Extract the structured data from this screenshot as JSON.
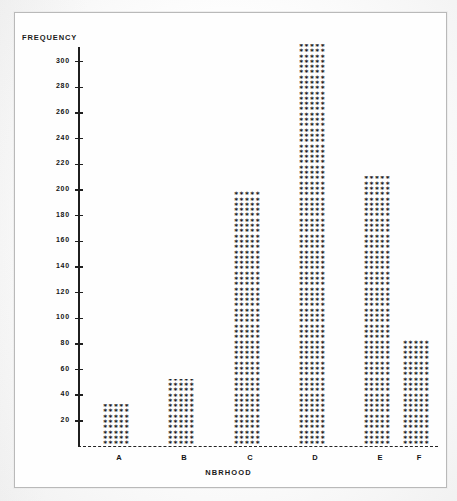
{
  "figure": {
    "frame_color": "#b9b9b9",
    "background": "#fdfdfd",
    "ink_color": "#121212"
  },
  "chart_data": {
    "type": "bar",
    "title": "",
    "xlabel": "NBRHOOD",
    "ylabel": "FREQUENCY",
    "categories": [
      "A",
      "B",
      "C",
      "D",
      "E",
      "F"
    ],
    "values": [
      33,
      53,
      200,
      314,
      211,
      83
    ],
    "ylim": [
      0,
      320
    ],
    "ytick_step": 20,
    "yticks": [
      20,
      40,
      60,
      80,
      100,
      120,
      140,
      160,
      180,
      200,
      220,
      240,
      260,
      280,
      300
    ],
    "ytick_labels": [
      "20",
      "40",
      "60",
      "80",
      "100",
      "120",
      "140",
      "160",
      "180",
      "200",
      "220",
      "240",
      "260",
      "280",
      "300"
    ],
    "grid": false,
    "legend": null,
    "baseline_style": "dashed",
    "bar_fill_glyph": "*",
    "bar_fill_columns": 5
  }
}
